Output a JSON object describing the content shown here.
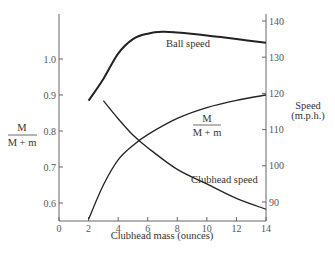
{
  "chart_data": {
    "type": "line",
    "title": "",
    "xlabel": "Clubhead mass (ounces)",
    "ylabel_left": "M / (M + m)",
    "ylabel_right": "Speed (m.p.h.)",
    "xlim": [
      0,
      14
    ],
    "ylim_left": [
      0.55,
      1.1
    ],
    "ylim_right": [
      85,
      141
    ],
    "x_ticks": [
      "0",
      "2",
      "4",
      "6",
      "8",
      "10",
      "12",
      "14"
    ],
    "y_left_ticks": [
      "0.6",
      "0.7",
      "0.8",
      "0.9",
      "1.0"
    ],
    "y_right_ticks": [
      "90",
      "100",
      "110",
      "120",
      "130",
      "140"
    ],
    "grid": false,
    "series": [
      {
        "name": "Ball speed",
        "axis": "right",
        "x": [
          2,
          3,
          4,
          5,
          6,
          7,
          8,
          10,
          12,
          14
        ],
        "values": [
          118,
          124,
          131,
          135,
          136.5,
          137,
          136.8,
          136,
          135,
          134
        ]
      },
      {
        "name": "Clubhead speed",
        "axis": "right",
        "x": [
          3,
          4,
          5,
          6,
          8,
          10,
          12,
          14
        ],
        "values": [
          118,
          113,
          108.5,
          105,
          99,
          95,
          91,
          88
        ]
      },
      {
        "name": "M/(M+m)",
        "axis": "left",
        "x": [
          2,
          3,
          4,
          5,
          6,
          8,
          10,
          12,
          14
        ],
        "values": [
          0.555,
          0.65,
          0.72,
          0.76,
          0.79,
          0.835,
          0.865,
          0.885,
          0.9
        ]
      }
    ],
    "annotations": [
      "Ball speed",
      "Clubhead speed",
      "M/(M+m)"
    ]
  },
  "labels": {
    "x_axis": "Clubhead mass (ounces)",
    "left_num": "M",
    "left_den": "M + m",
    "right_1": "Speed",
    "right_2": "(m.p.h.)",
    "ball": "Ball speed",
    "club": "Clubhead speed",
    "frac_num": "M",
    "frac_den": "M + m"
  }
}
